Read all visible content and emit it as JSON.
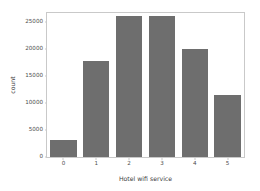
{
  "chart_data": {
    "type": "bar",
    "title": "",
    "xlabel": "Hotel wifi service",
    "ylabel": "count",
    "categories": [
      "0",
      "1",
      "2",
      "3",
      "4",
      "5"
    ],
    "values": [
      3100,
      17800,
      26000,
      26000,
      19900,
      11400
    ],
    "series": [
      {
        "name": "count",
        "values": [
          3100,
          17800,
          26000,
          26000,
          19900,
          11400
        ]
      }
    ],
    "yticks": [
      0,
      5000,
      10000,
      15000,
      20000,
      25000
    ],
    "ytick_labels": [
      "0",
      "5000",
      "10000",
      "15000",
      "20000",
      "25000"
    ],
    "xtick_labels": [
      "0",
      "1",
      "2",
      "3",
      "4",
      "5"
    ],
    "ylim": [
      0,
      26600
    ],
    "xlim": [
      -0.5,
      5.5
    ],
    "grid": false,
    "legend": false,
    "bar_color": "#6e6e6e",
    "axes_color": "#c9c9c9",
    "text_color": "#4d4d4d",
    "background": "#ffffff"
  }
}
